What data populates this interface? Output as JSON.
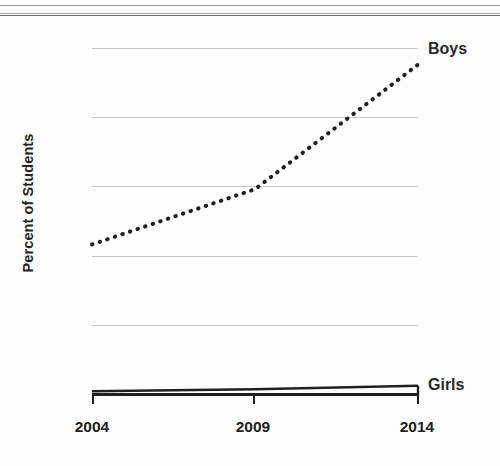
{
  "chart_data": {
    "type": "line",
    "title": "",
    "xlabel": "",
    "ylabel": "Percent of Students",
    "x": [
      2004,
      2009,
      2014
    ],
    "categories": [
      "2004",
      "2009",
      "2014"
    ],
    "xtick_labels": [
      "2004",
      "2009",
      "2014"
    ],
    "ytick_labels": [
      "0",
      "5",
      "10",
      "15",
      "20",
      "25"
    ],
    "yticks": [
      0,
      5,
      10,
      15,
      20,
      25
    ],
    "ylim": [
      0,
      26
    ],
    "xlim": [
      2004,
      2014
    ],
    "grid": "horizontal",
    "legend_position": "inline-right-of-series-end",
    "series": [
      {
        "name": "Boys",
        "label": "Boys",
        "style": "dotted",
        "color": "#1f1f1f",
        "values": [
          10.8,
          14.8,
          23.8
        ]
      },
      {
        "name": "Girls",
        "label": "Girls",
        "style": "solid",
        "color": "#1f1f1f",
        "values": [
          0.2,
          0.35,
          0.6
        ]
      }
    ]
  },
  "axes": {
    "y_title": "Percent of Students",
    "y_labels": [
      "25",
      "20",
      "15",
      "10",
      "5",
      "0"
    ],
    "x_labels": [
      "2004",
      "2009",
      "2014"
    ]
  },
  "labels": {
    "boys": "Boys",
    "girls": "Girls"
  },
  "colors": {
    "ink": "#1f1f1f",
    "grid": "#c8c8c8",
    "background": "#fdfdfd"
  }
}
